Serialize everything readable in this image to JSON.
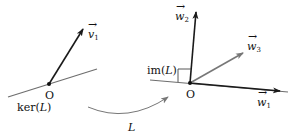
{
  "diagram": {
    "left": {
      "origin_label": "O",
      "kernel_label": "ker(L)",
      "vector_label_base": "v",
      "vector_label_sub": "1"
    },
    "right": {
      "origin_label": "O",
      "image_label": "im(L)",
      "vectors": [
        {
          "base": "w",
          "sub": "1"
        },
        {
          "base": "w",
          "sub": "2"
        },
        {
          "base": "w",
          "sub": "3"
        }
      ]
    },
    "map_label": "L",
    "colors": {
      "line": "#6e6e6e",
      "vector_dark": "#1a1a1a",
      "vector_gray": "#777777"
    }
  }
}
